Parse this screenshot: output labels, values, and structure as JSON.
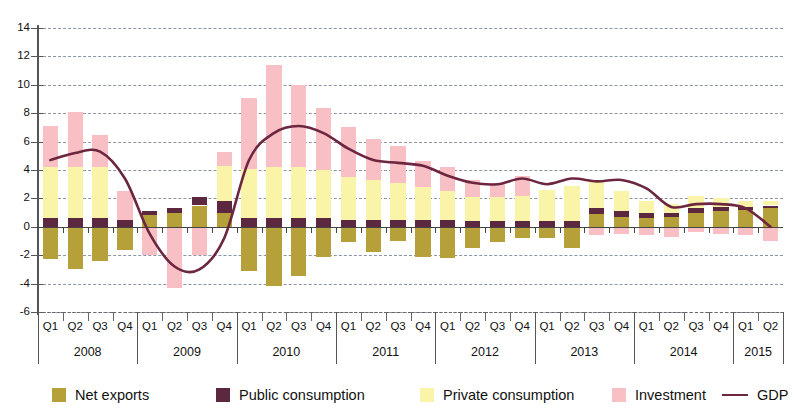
{
  "chart_data": {
    "type": "bar",
    "subtype": "stacked-bar-with-line",
    "title": "",
    "xlabel": "",
    "ylabel": "",
    "ylim": [
      -6,
      14
    ],
    "ytick_step": 2,
    "ytick_labels": [
      "14",
      "12",
      "10",
      "8",
      "6",
      "4",
      "2",
      "0",
      "-2",
      "-4",
      "-6"
    ],
    "ytick_values": [
      14,
      12,
      10,
      8,
      6,
      4,
      2,
      0,
      -2,
      -4,
      -6
    ],
    "grid": true,
    "grid_style": "dashed-horizontal",
    "legend_position": "bottom",
    "quarters": [
      "Q1",
      "Q2",
      "Q3",
      "Q4",
      "Q1",
      "Q2",
      "Q3",
      "Q4",
      "Q1",
      "Q2",
      "Q3",
      "Q4",
      "Q1",
      "Q2",
      "Q3",
      "Q4",
      "Q1",
      "Q2",
      "Q3",
      "Q4",
      "Q1",
      "Q2",
      "Q3",
      "Q4",
      "Q1",
      "Q2",
      "Q3",
      "Q4",
      "Q1",
      "Q2"
    ],
    "quarter_labels": [
      "Q1",
      "Q2",
      "Q3",
      "Q4"
    ],
    "years": [
      {
        "label": "2008",
        "quarters": 4
      },
      {
        "label": "2009",
        "quarters": 4
      },
      {
        "label": "2010",
        "quarters": 4
      },
      {
        "label": "2011",
        "quarters": 4
      },
      {
        "label": "2012",
        "quarters": 4
      },
      {
        "label": "2013",
        "quarters": 4
      },
      {
        "label": "2014",
        "quarters": 4
      },
      {
        "label": "2015",
        "quarters": 2
      }
    ],
    "categories": [
      "2008 Q1",
      "2008 Q2",
      "2008 Q3",
      "2008 Q4",
      "2009 Q1",
      "2009 Q2",
      "2009 Q3",
      "2009 Q4",
      "2010 Q1",
      "2010 Q2",
      "2010 Q3",
      "2010 Q4",
      "2011 Q1",
      "2011 Q2",
      "2011 Q3",
      "2011 Q4",
      "2012 Q1",
      "2012 Q2",
      "2012 Q3",
      "2012 Q4",
      "2013 Q1",
      "2013 Q2",
      "2013 Q3",
      "2013 Q4",
      "2014 Q1",
      "2014 Q2",
      "2014 Q3",
      "2014 Q4",
      "2015 Q1",
      "2015 Q2"
    ],
    "series": [
      {
        "name": "Net exports",
        "color": "#b5a03a",
        "values": [
          -2.3,
          -3.0,
          -2.4,
          -1.6,
          0.8,
          1.0,
          1.5,
          1.0,
          -3.1,
          -4.2,
          -3.5,
          -2.1,
          -1.1,
          -1.8,
          -1.0,
          -2.1,
          -2.2,
          -1.5,
          -1.1,
          -0.8,
          -0.8,
          -1.5,
          0.9,
          0.7,
          0.6,
          0.7,
          1.0,
          1.1,
          1.2,
          1.3
        ]
      },
      {
        "name": "Public consumption",
        "color": "#5c2840",
        "values": [
          0.6,
          0.6,
          0.6,
          0.5,
          0.3,
          0.3,
          0.6,
          0.8,
          0.6,
          0.6,
          0.6,
          0.6,
          0.5,
          0.5,
          0.5,
          0.5,
          0.5,
          0.4,
          0.4,
          0.4,
          0.4,
          0.4,
          0.4,
          0.4,
          0.4,
          0.3,
          0.3,
          0.3,
          0.2,
          0.2
        ]
      },
      {
        "name": "Private consumption",
        "color": "#faf4a8",
        "values": [
          3.6,
          3.6,
          3.6,
          0.0,
          0.0,
          0.0,
          0.0,
          2.5,
          3.5,
          3.6,
          3.6,
          3.4,
          3.0,
          2.8,
          2.6,
          2.3,
          2.0,
          1.7,
          1.7,
          1.8,
          2.2,
          2.5,
          2.0,
          1.4,
          0.8,
          0.6,
          0.9,
          0.6,
          0.4,
          0.3
        ]
      },
      {
        "name": "Investment",
        "color": "#f8c0c4",
        "values": [
          2.9,
          3.9,
          2.3,
          2.0,
          -2.0,
          -4.3,
          -2.0,
          1.0,
          5.0,
          7.2,
          5.8,
          4.4,
          3.5,
          2.9,
          2.6,
          1.8,
          1.7,
          1.2,
          1.0,
          1.4,
          0.0,
          0.0,
          -0.6,
          -0.5,
          -0.6,
          -0.7,
          -0.4,
          -0.5,
          -0.6,
          -1.0
        ]
      }
    ],
    "line_series": {
      "name": "GDP",
      "color": "#6d2640",
      "values": [
        4.7,
        5.2,
        5.3,
        3.4,
        -0.5,
        -2.8,
        -3.0,
        -0.8,
        4.7,
        6.6,
        7.1,
        6.6,
        5.5,
        4.7,
        4.5,
        4.3,
        3.6,
        3.1,
        3.0,
        3.4,
        3.0,
        3.4,
        3.2,
        3.3,
        2.7,
        1.4,
        1.6,
        1.6,
        1.3,
        0.0
      ]
    },
    "legend": [
      {
        "label": "Net exports",
        "color": "#b5a03a",
        "icon": "square-swatch"
      },
      {
        "label": "Public consumption",
        "color": "#5c2840",
        "icon": "square-swatch"
      },
      {
        "label": "Private consumption",
        "color": "#faf4a8",
        "icon": "square-swatch"
      },
      {
        "label": "Investment",
        "color": "#f8c0c4",
        "icon": "square-swatch"
      },
      {
        "label": "GDP",
        "color": "#6d2640",
        "icon": "line-swatch"
      }
    ]
  }
}
